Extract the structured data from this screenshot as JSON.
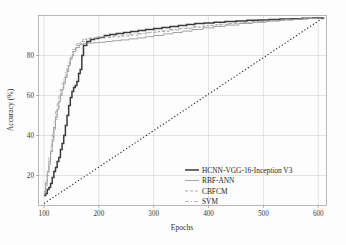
{
  "chart_data": {
    "type": "line",
    "title": "",
    "xlabel": "Epochs",
    "ylabel": "Accuracy (%)",
    "xlim": [
      90,
      615
    ],
    "ylim": [
      5,
      100
    ],
    "xticks": [
      100,
      200,
      300,
      400,
      500,
      600
    ],
    "yticks": [
      20,
      40,
      60,
      80
    ],
    "xtick_labels": [
      "100",
      "200",
      "300",
      "400",
      "500",
      "600"
    ],
    "ytick_labels": [
      "20",
      "40",
      "60",
      "80"
    ],
    "grid": true,
    "legend_position": "lower-right-inside",
    "series": [
      {
        "name": "HCNN-VGG-16-Inception V3",
        "style": "solid",
        "width": 1.5,
        "color": "#3a3a3a",
        "x": [
          100,
          103,
          106,
          109,
          112,
          115,
          118,
          121,
          124,
          127,
          130,
          133,
          136,
          139,
          142,
          145,
          148,
          151,
          154,
          157,
          160,
          163,
          166,
          169,
          172,
          178,
          185,
          192,
          200,
          210,
          220,
          232,
          245,
          258,
          272,
          285,
          300,
          315,
          330,
          345,
          360,
          375,
          392,
          410,
          430,
          450,
          470,
          490,
          510,
          530,
          550,
          570,
          590,
          610
        ],
        "y": [
          10,
          11,
          13,
          14,
          16,
          19,
          22,
          24,
          27,
          29,
          33,
          36,
          40,
          45,
          50,
          55,
          59,
          62,
          64,
          65,
          67,
          71,
          73,
          80,
          85,
          87,
          88,
          88.5,
          89,
          90,
          90.5,
          91,
          91.5,
          92,
          92.5,
          93,
          93.5,
          94,
          94.5,
          95,
          95.5,
          96,
          96.3,
          96.6,
          97,
          97.3,
          97.6,
          97.8,
          98,
          98.2,
          98.4,
          98.6,
          98.8,
          99
        ]
      },
      {
        "name": "RBF-ANN",
        "style": "solid",
        "width": 0.8,
        "color": "#8d8d8d",
        "x": [
          100,
          103,
          106,
          109,
          112,
          115,
          118,
          121,
          124,
          127,
          130,
          133,
          136,
          139,
          142,
          145,
          148,
          151,
          154,
          158,
          165,
          172,
          180,
          190,
          200,
          212,
          225,
          240,
          255,
          270,
          285,
          300,
          318,
          335,
          352,
          370,
          390,
          410,
          430,
          455,
          480,
          505,
          530,
          555,
          580,
          610
        ],
        "y": [
          12,
          16,
          22,
          27,
          32,
          38,
          44,
          49,
          53,
          57,
          60,
          63,
          66,
          69,
          72,
          75,
          78,
          80,
          82,
          84,
          85.5,
          86,
          86.2,
          86.4,
          86.6,
          87,
          87.4,
          87.8,
          88.3,
          88.8,
          89.4,
          90,
          90.8,
          91.5,
          92.2,
          93,
          93.8,
          94.5,
          95.2,
          96,
          96.6,
          97.2,
          97.7,
          98.1,
          98.5,
          99
        ]
      },
      {
        "name": "CBFCM",
        "style": "dashed",
        "width": 0.8,
        "color": "#9b9b9b",
        "x": [
          100,
          103,
          106,
          109,
          112,
          115,
          118,
          121,
          124,
          127,
          130,
          133,
          136,
          139,
          142,
          145,
          148,
          152,
          158,
          166,
          175,
          185,
          196,
          208,
          222,
          238,
          254,
          272,
          290,
          308,
          328,
          348,
          368,
          390,
          412,
          436,
          460,
          485,
          512,
          540,
          570,
          610
        ],
        "y": [
          11,
          15,
          20,
          25,
          31,
          37,
          43,
          48,
          53,
          57,
          61,
          64,
          67,
          70,
          73,
          76,
          79,
          82,
          85,
          87,
          88.2,
          88.6,
          88.8,
          89,
          89.3,
          89.7,
          90.2,
          90.8,
          91.4,
          92,
          92.7,
          93.4,
          94.1,
          94.8,
          95.4,
          96,
          96.6,
          97.1,
          97.6,
          98.1,
          98.5,
          99
        ]
      },
      {
        "name": "SVM",
        "style": "dashdot",
        "width": 0.8,
        "color": "#a5a5a5",
        "x": [
          100,
          103,
          106,
          109,
          112,
          115,
          118,
          121,
          124,
          127,
          130,
          133,
          136,
          139,
          142,
          146,
          152,
          160,
          170,
          182,
          195,
          210,
          226,
          244,
          262,
          282,
          302,
          324,
          346,
          370,
          394,
          420,
          446,
          474,
          502,
          532,
          562,
          610
        ],
        "y": [
          11.5,
          17,
          23,
          29,
          35,
          41,
          47,
          52,
          56,
          60,
          63,
          66,
          69,
          72,
          75,
          79,
          83,
          86,
          88,
          88.8,
          89.2,
          89.5,
          89.9,
          90.4,
          91,
          91.6,
          92.3,
          93,
          93.7,
          94.4,
          95.1,
          95.8,
          96.4,
          97,
          97.5,
          98,
          98.4,
          99
        ]
      },
      {
        "name": "reference-diagonal",
        "style": "dotted",
        "width": 1.1,
        "color": "#222222",
        "x": [
          100,
          610
        ],
        "y": [
          6,
          99
        ]
      }
    ]
  },
  "legend": {
    "items": [
      {
        "label": "HCNN-VGG-16-Inception V3",
        "style": "solid-bold"
      },
      {
        "label": "RBF-ANN",
        "style": "solid-thin"
      },
      {
        "label": "CBFCM",
        "style": "dashed"
      },
      {
        "label": "SVM",
        "style": "dashdot"
      }
    ]
  }
}
